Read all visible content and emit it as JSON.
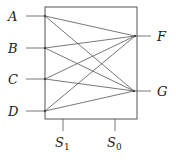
{
  "diagram": {
    "type": "multiplexer-crossbar",
    "box": {
      "x": 45,
      "y": 7,
      "width": 92,
      "height": 112
    },
    "inputs": [
      {
        "id": "A",
        "label": "A",
        "x": 45,
        "y": 16,
        "label_x": 8,
        "line_start_x": 26
      },
      {
        "id": "B",
        "label": "B",
        "x": 45,
        "y": 48,
        "label_x": 8,
        "line_start_x": 26
      },
      {
        "id": "C",
        "label": "C",
        "x": 45,
        "y": 79,
        "label_x": 8,
        "line_start_x": 26
      },
      {
        "id": "D",
        "label": "D",
        "x": 45,
        "y": 111,
        "label_x": 8,
        "line_start_x": 26
      }
    ],
    "outputs": [
      {
        "id": "F",
        "label": "F",
        "x": 135,
        "y": 36,
        "label_x": 157,
        "line_end_x": 151
      },
      {
        "id": "G",
        "label": "G",
        "x": 134,
        "y": 91,
        "label_x": 157,
        "line_end_x": 151
      }
    ],
    "connections": [
      [
        "A",
        "F"
      ],
      [
        "A",
        "G"
      ],
      [
        "B",
        "F"
      ],
      [
        "B",
        "G"
      ],
      [
        "C",
        "F"
      ],
      [
        "C",
        "G"
      ],
      [
        "D",
        "F"
      ],
      [
        "D",
        "G"
      ]
    ],
    "selects": [
      {
        "id": "S1",
        "label": "S",
        "subscript": "1",
        "x": 63,
        "y_top": 119,
        "y_bottom": 131,
        "label_y": 147
      },
      {
        "id": "S0",
        "label": "S",
        "subscript": "0",
        "x": 115,
        "y_top": 119,
        "y_bottom": 131,
        "label_y": 147
      }
    ],
    "colors": {
      "stroke": "#555555",
      "text": "#222222",
      "background": "#ffffff"
    }
  }
}
